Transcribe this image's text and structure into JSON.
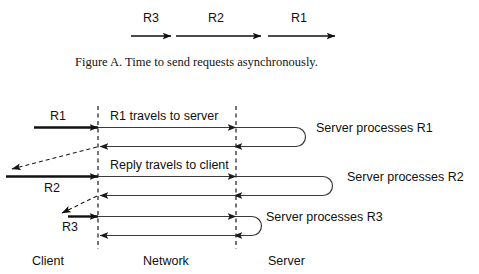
{
  "figure": {
    "caption": "Figure A.   Time to send requests asynchronously.",
    "caption_prefix": "Figure A.",
    "caption_text": "Time to send requests asynchronously."
  },
  "top_timeline": {
    "requests": [
      {
        "label": "R3",
        "note": "shortest segment"
      },
      {
        "label": "R2",
        "note": "longest segment"
      },
      {
        "label": "R1",
        "note": "medium segment"
      }
    ]
  },
  "main_diagram": {
    "zones": [
      {
        "label": "Client"
      },
      {
        "label": "Network"
      },
      {
        "label": "Server"
      }
    ],
    "request_labels": [
      {
        "label": "R1"
      },
      {
        "label": "R2"
      },
      {
        "label": "R3"
      }
    ],
    "network_labels": [
      {
        "label": "R1 travels to server"
      },
      {
        "label": "Reply travels to client"
      }
    ],
    "server_labels": [
      {
        "label": "Server processes R1"
      },
      {
        "label": "Server processes R2"
      },
      {
        "label": "Server processes R3"
      }
    ]
  },
  "colors": {
    "ink": "#111111",
    "thin_ink": "#3a3a3a",
    "background": "#ffffff"
  }
}
